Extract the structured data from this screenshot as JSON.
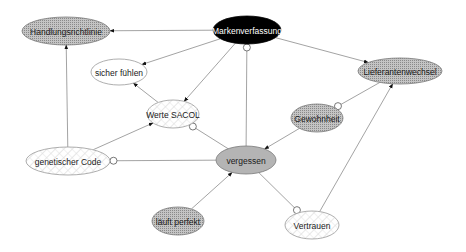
{
  "diagram": {
    "type": "concept-map",
    "nodes": [
      {
        "id": "markenverfassung",
        "label": "Markenverfassung",
        "cx": 247,
        "cy": 30,
        "rx": 34,
        "ry": 14,
        "style": "black"
      },
      {
        "id": "handlungsrichtlinie",
        "label": "Handlungsrichtlinie",
        "cx": 66,
        "cy": 31,
        "rx": 44,
        "ry": 14,
        "style": "dotted-gray"
      },
      {
        "id": "lieferantenwechsel",
        "label": "Lieferantenwechsel",
        "cx": 400,
        "cy": 71,
        "rx": 42,
        "ry": 13,
        "style": "dotted-gray"
      },
      {
        "id": "sicher-fuehlen",
        "label": "sicher fühlen",
        "cx": 119,
        "cy": 72,
        "rx": 28,
        "ry": 13,
        "style": "white"
      },
      {
        "id": "werte-sacol",
        "label": "Werte SACOL",
        "cx": 173,
        "cy": 114,
        "rx": 26,
        "ry": 14,
        "style": "hatched"
      },
      {
        "id": "gewohnheit",
        "label": "Gewohnheit",
        "cx": 317,
        "cy": 118,
        "rx": 26,
        "ry": 14,
        "style": "dotted-gray"
      },
      {
        "id": "genetischer-code",
        "label": "genetischer Code",
        "cx": 68,
        "cy": 161,
        "rx": 42,
        "ry": 14,
        "style": "hatched"
      },
      {
        "id": "vergessen",
        "label": "vergessen",
        "cx": 246,
        "cy": 160,
        "rx": 30,
        "ry": 14,
        "style": "gray"
      },
      {
        "id": "laeuft-perfekt",
        "label": "läuft perfekt",
        "cx": 178,
        "cy": 221,
        "rx": 26,
        "ry": 14,
        "style": "dotted-gray"
      },
      {
        "id": "vertrauen",
        "label": "Vertrauen",
        "cx": 312,
        "cy": 225,
        "rx": 27,
        "ry": 14,
        "style": "hatched"
      }
    ],
    "edges": [
      {
        "from": "markenverfassung",
        "to": "handlungsrichtlinie",
        "end": "arrow"
      },
      {
        "from": "markenverfassung",
        "to": "sicher-fuehlen",
        "end": "arrow"
      },
      {
        "from": "markenverfassung",
        "to": "werte-sacol",
        "end": "arrow"
      },
      {
        "from": "markenverfassung",
        "to": "lieferantenwechsel",
        "end": "arrow"
      },
      {
        "from": "vergessen",
        "to": "markenverfassung",
        "end": "circle"
      },
      {
        "from": "werte-sacol",
        "to": "sicher-fuehlen",
        "end": "arrow"
      },
      {
        "from": "genetischer-code",
        "to": "handlungsrichtlinie",
        "end": "arrow"
      },
      {
        "from": "genetischer-code",
        "to": "werte-sacol",
        "end": "arrow"
      },
      {
        "from": "vergessen",
        "to": "genetischer-code",
        "end": "circle"
      },
      {
        "from": "vergessen",
        "to": "werte-sacol",
        "end": "circle"
      },
      {
        "from": "gewohnheit",
        "to": "vergessen",
        "end": "arrow"
      },
      {
        "from": "lieferantenwechsel",
        "to": "gewohnheit",
        "end": "circle"
      },
      {
        "from": "laeuft-perfekt",
        "to": "vergessen",
        "end": "arrow"
      },
      {
        "from": "vergessen",
        "to": "vertrauen",
        "end": "circle"
      },
      {
        "from": "vertrauen",
        "to": "lieferantenwechsel",
        "end": "arrow"
      }
    ],
    "colors": {
      "black_fill": "#000000",
      "gray_fill": "#b4b4b4",
      "dotted_gray_fill": "#a8a8a8",
      "white_fill": "#ffffff",
      "hatch_line": "#c8c8c8",
      "stroke": "#7a7a7a",
      "edge": "#8c8c8c",
      "text_dark": "#1a1a1a",
      "text_light": "#ffffff"
    }
  }
}
